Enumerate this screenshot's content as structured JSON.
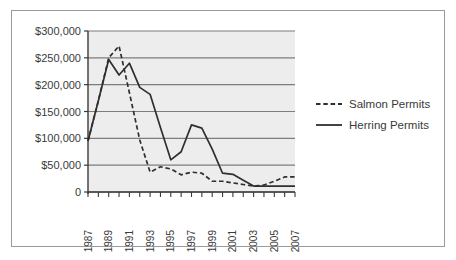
{
  "figure": {
    "border_color": "#9a9a9a",
    "background": "#ffffff"
  },
  "chart_data": {
    "type": "line",
    "title": "",
    "subtitle": "",
    "xlabel": "",
    "ylabel": "",
    "plot_background": "#ededed",
    "grid": true,
    "grid_color": "#7d7d7d",
    "legend_position": "right",
    "xlim": [
      1987,
      2007
    ],
    "ylim": [
      0,
      300000
    ],
    "x": [
      1987,
      1988,
      1989,
      1990,
      1991,
      1992,
      1993,
      1994,
      1995,
      1996,
      1997,
      1998,
      1999,
      2000,
      2001,
      2002,
      2003,
      2004,
      2005,
      2006,
      2007
    ],
    "x_tick_labels": [
      "1987",
      "",
      "1989",
      "",
      "1991",
      "",
      "1993",
      "",
      "1995",
      "",
      "1997",
      "",
      "1999",
      "",
      "2001",
      "",
      "2003",
      "",
      "2005",
      "",
      "2007"
    ],
    "x_tick_labels_shown": [
      "1987",
      "1989",
      "1991",
      "1993",
      "1995",
      "1997",
      "1999",
      "2001",
      "2003",
      "2005",
      "2007"
    ],
    "y_ticks": [
      0,
      50000,
      100000,
      150000,
      200000,
      250000,
      300000
    ],
    "y_tick_labels": [
      "0",
      "$50,000",
      "$100,000",
      "$150,000",
      "$200,000",
      "$250,000",
      "$300,000"
    ],
    "series": [
      {
        "name": "Salmon Permits",
        "style": "dashed",
        "color": "#2f2f2f",
        "values": [
          95000,
          170000,
          250000,
          272000,
          185000,
          97000,
          37000,
          47000,
          43000,
          32000,
          37000,
          35000,
          20000,
          20000,
          17000,
          14000,
          11000,
          13000,
          20000,
          28000,
          28000
        ]
      },
      {
        "name": "Herring Permits",
        "style": "solid",
        "color": "#2f2f2f",
        "values": [
          95000,
          170000,
          247000,
          218000,
          240000,
          195000,
          182000,
          120000,
          60000,
          75000,
          125000,
          119000,
          80000,
          35000,
          33000,
          22000,
          11000,
          11000,
          11000,
          11000,
          11000
        ]
      }
    ]
  },
  "legend": {
    "items": [
      {
        "label": "Salmon Permits",
        "style": "dashed"
      },
      {
        "label": "Herring Permits",
        "style": "solid"
      }
    ]
  }
}
